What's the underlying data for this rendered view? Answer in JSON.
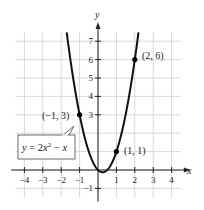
{
  "chart_data": {
    "type": "line",
    "title": "",
    "xlabel": "x",
    "ylabel": "y",
    "xlim": [
      -4.5,
      4.5
    ],
    "ylim": [
      -1.5,
      7.5
    ],
    "grid": true,
    "x_ticks": [
      -4,
      -3,
      -2,
      -1,
      1,
      2,
      3,
      4
    ],
    "x_tick_labels": [
      "−4",
      "−3",
      "−2",
      "−1",
      "1",
      "2",
      "3",
      "4"
    ],
    "y_ticks": [
      -1,
      3,
      4,
      5,
      6,
      7
    ],
    "y_tick_labels": [
      "−1",
      "3",
      "4",
      "5",
      "6",
      "7"
    ],
    "series": [
      {
        "name": "y = 2x² − x",
        "equation": "y = 2x^2 - x",
        "color": "#111111",
        "x_range": [
          -1.7,
          2.3
        ]
      }
    ],
    "points": [
      {
        "x": -1,
        "y": 3,
        "label": "(−1, 3)"
      },
      {
        "x": 1,
        "y": 1,
        "label": "(1, 1)"
      },
      {
        "x": 2,
        "y": 6,
        "label": "(2, 6)"
      }
    ],
    "annotations": [
      {
        "text": "y = 2x² − x",
        "type": "callout-box"
      }
    ]
  },
  "labels": {
    "x_axis": "x",
    "y_axis": "y",
    "equation_y": "y",
    "equation_eq": " = 2",
    "equation_x": "x",
    "equation_exp": "2",
    "equation_tail": " − ",
    "equation_x2": "x",
    "point_a": "(−1, 3)",
    "point_b": "(1, 1)",
    "point_c": "(2, 6)"
  },
  "colors": {
    "grid": "#c8c8c8",
    "axis": "#222222",
    "curve": "#111111",
    "label_box_border": "#444444"
  }
}
